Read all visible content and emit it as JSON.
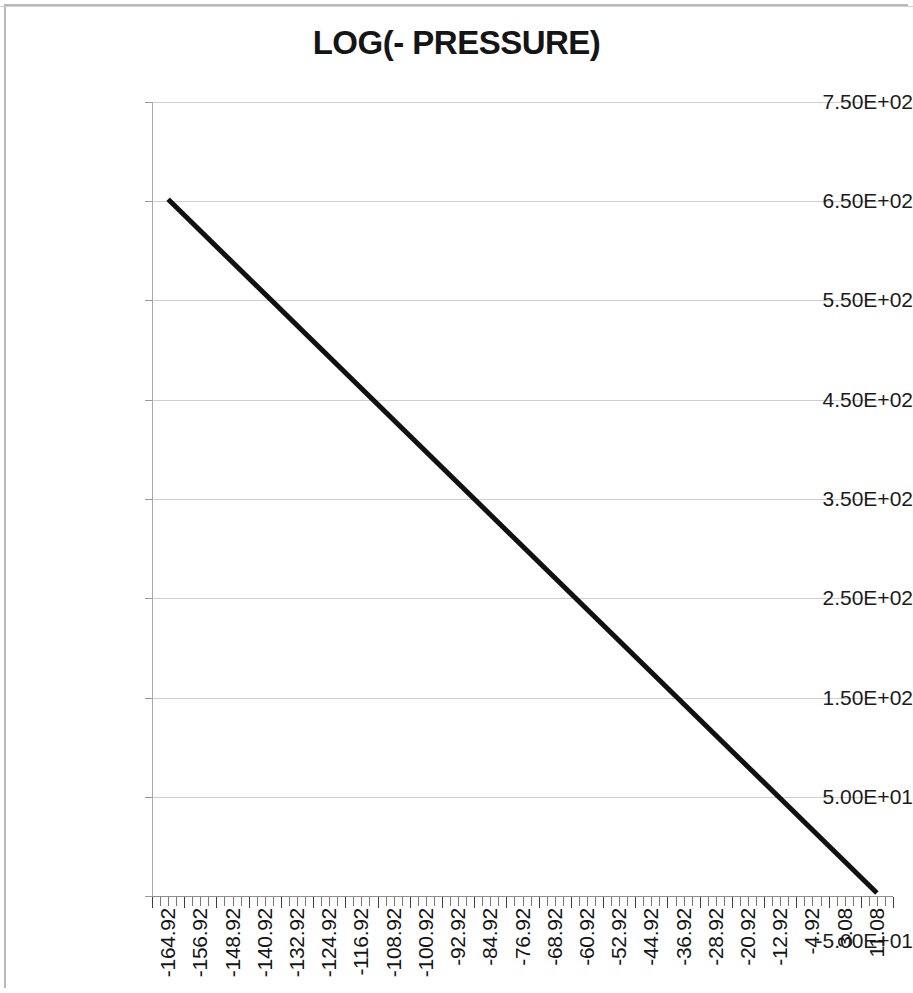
{
  "chart_data": {
    "type": "line",
    "title": "LOG(- PRESSURE)",
    "xlabel": "",
    "ylabel": "",
    "grid": true,
    "legend": "none",
    "x_tick_labels": [
      "-164.92",
      "-156.92",
      "-148.92",
      "-140.92",
      "-132.92",
      "-124.92",
      "-116.92",
      "-108.92",
      "-100.92",
      "-92.92",
      "-84.92",
      "-76.92",
      "-68.92",
      "-60.92",
      "-52.92",
      "-44.92",
      "-36.92",
      "-28.92",
      "-20.92",
      "-12.92",
      "-4.92",
      "3.08",
      "11.08"
    ],
    "y_tick_labels": [
      "7.50E+02",
      "6.50E+02",
      "5.50E+02",
      "4.50E+02",
      "3.50E+02",
      "2.50E+02",
      "1.50E+02",
      "5.00E+01",
      "-5.00E+01"
    ],
    "y_tick_values": [
      750,
      650,
      550,
      450,
      350,
      250,
      150,
      50,
      -50
    ],
    "ylim": [
      -50,
      750
    ],
    "xlim": [
      -164.92,
      13.08
    ],
    "x_tick_step": 8,
    "series": [
      {
        "name": "LOG(- PRESSURE)",
        "color": "#111111",
        "line_width": 5,
        "x": [
          -164.92,
          11.08
        ],
        "values": [
          652,
          -47
        ]
      }
    ],
    "data_points": [
      {
        "x": -164.92,
        "y": 652
      },
      {
        "x": -156.92,
        "y": 620
      },
      {
        "x": -148.92,
        "y": 588
      },
      {
        "x": -140.92,
        "y": 556
      },
      {
        "x": -132.92,
        "y": 525
      },
      {
        "x": -124.92,
        "y": 493
      },
      {
        "x": -116.92,
        "y": 461
      },
      {
        "x": -108.92,
        "y": 429
      },
      {
        "x": -100.92,
        "y": 397
      },
      {
        "x": -92.92,
        "y": 366
      },
      {
        "x": -84.92,
        "y": 334
      },
      {
        "x": -76.92,
        "y": 302
      },
      {
        "x": -68.92,
        "y": 270
      },
      {
        "x": -60.92,
        "y": 238
      },
      {
        "x": -52.92,
        "y": 207
      },
      {
        "x": -44.92,
        "y": 175
      },
      {
        "x": -36.92,
        "y": 143
      },
      {
        "x": -28.92,
        "y": 111
      },
      {
        "x": -20.92,
        "y": 79
      },
      {
        "x": -12.92,
        "y": 48
      },
      {
        "x": -4.92,
        "y": 16
      },
      {
        "x": 3.08,
        "y": -16
      },
      {
        "x": 11.08,
        "y": -47
      }
    ],
    "colors": {
      "line": "#111111",
      "gridline": "#cfcfcf",
      "axis": "#8f8f8f",
      "text": "#151515",
      "background": "#ffffff"
    }
  }
}
